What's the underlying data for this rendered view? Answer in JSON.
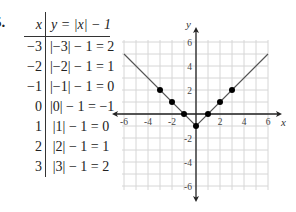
{
  "problem_number": "5.",
  "table": {
    "header_x": "x",
    "header_y": "y = |x| − 1",
    "rows": [
      {
        "x": "−3",
        "y": "|−3| − 1 = 2"
      },
      {
        "x": "−2",
        "y": "|−2| − 1 = 1"
      },
      {
        "x": "−1",
        "y": "|−1| − 1 = 0"
      },
      {
        "x": "0",
        "y": "|0| − 1 = −1"
      },
      {
        "x": "1",
        "y": "|1| − 1 = 0"
      },
      {
        "x": "2",
        "y": "|2| − 1 = 1"
      },
      {
        "x": "3",
        "y": "|3| − 1 = 2"
      }
    ]
  },
  "colors": {
    "grid": "#d6d6d6",
    "axis": "#222222",
    "line": "#555555",
    "point": "#000000"
  },
  "chart_data": {
    "type": "line",
    "title": "",
    "function": "y = |x| - 1",
    "xlabel": "x",
    "ylabel": "y",
    "xlim": [
      -6,
      6
    ],
    "ylim": [
      -6,
      6
    ],
    "grid": true,
    "x_ticks": [
      -6,
      -4,
      -2,
      2,
      4,
      6
    ],
    "y_ticks": [
      6,
      4,
      2,
      -2,
      -4,
      -6
    ],
    "points": [
      {
        "x": -3,
        "y": 2
      },
      {
        "x": -2,
        "y": 1
      },
      {
        "x": -1,
        "y": 0
      },
      {
        "x": 0,
        "y": -1
      },
      {
        "x": 1,
        "y": 0
      },
      {
        "x": 2,
        "y": 1
      },
      {
        "x": 3,
        "y": 2
      }
    ],
    "line": [
      {
        "x": -6,
        "y": 5
      },
      {
        "x": 0,
        "y": -1
      },
      {
        "x": 6,
        "y": 5
      }
    ]
  }
}
